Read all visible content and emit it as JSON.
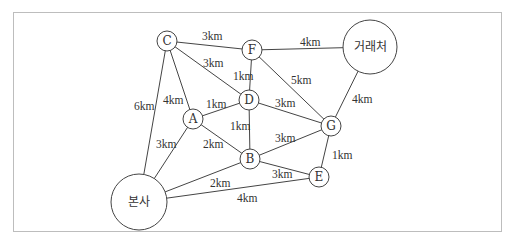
{
  "diagram": {
    "type": "weighted-graph",
    "frame": {
      "border_color": "#bdbdbd"
    },
    "nodes": [
      {
        "id": "C",
        "label": "C",
        "x": 167,
        "y": 41,
        "r": 10
      },
      {
        "id": "F",
        "label": "F",
        "x": 252,
        "y": 50,
        "r": 10
      },
      {
        "id": "D",
        "label": "D",
        "x": 249,
        "y": 100,
        "r": 10
      },
      {
        "id": "A",
        "label": "A",
        "x": 193,
        "y": 119,
        "r": 10
      },
      {
        "id": "G",
        "label": "G",
        "x": 331,
        "y": 126,
        "r": 10
      },
      {
        "id": "B",
        "label": "B",
        "x": 250,
        "y": 159,
        "r": 10
      },
      {
        "id": "E",
        "label": "E",
        "x": 319,
        "y": 177,
        "r": 10
      },
      {
        "id": "HQ",
        "label": "본사",
        "x": 139,
        "y": 202,
        "r": 28
      },
      {
        "id": "CLIENT",
        "label": "거래처",
        "x": 370,
        "y": 47,
        "r": 27
      }
    ],
    "edges": [
      {
        "from": "C",
        "to": "F",
        "label": "3km",
        "lx": 202,
        "ly": 40
      },
      {
        "from": "F",
        "to": "CLIENT",
        "label": "4km",
        "lx": 300,
        "ly": 46
      },
      {
        "from": "C",
        "to": "D",
        "label": "3km",
        "lx": 203,
        "ly": 67
      },
      {
        "from": "F",
        "to": "D",
        "label": "1km",
        "lx": 233,
        "ly": 80
      },
      {
        "from": "F",
        "to": "G",
        "label": "5km",
        "lx": 291,
        "ly": 84
      },
      {
        "from": "CLIENT",
        "to": "G",
        "label": "4km",
        "lx": 352,
        "ly": 103
      },
      {
        "from": "C",
        "to": "HQ",
        "label": "6km",
        "lx": 134,
        "ly": 110
      },
      {
        "from": "C",
        "to": "A",
        "label": "4km",
        "lx": 163,
        "ly": 104
      },
      {
        "from": "A",
        "to": "D",
        "label": "1km",
        "lx": 206,
        "ly": 108
      },
      {
        "from": "D",
        "to": "G",
        "label": "3km",
        "lx": 275,
        "ly": 107
      },
      {
        "from": "D",
        "to": "B",
        "label": "1km",
        "lx": 230,
        "ly": 130
      },
      {
        "from": "A",
        "to": "HQ",
        "label": "3km",
        "lx": 156,
        "ly": 148
      },
      {
        "from": "A",
        "to": "B",
        "label": "2km",
        "lx": 203,
        "ly": 148
      },
      {
        "from": "B",
        "to": "G",
        "label": "3km",
        "lx": 275,
        "ly": 142
      },
      {
        "from": "G",
        "to": "E",
        "label": "1km",
        "lx": 332,
        "ly": 159
      },
      {
        "from": "B",
        "to": "E",
        "label": "3km",
        "lx": 272,
        "ly": 178
      },
      {
        "from": "HQ",
        "to": "B",
        "label": "2km",
        "lx": 210,
        "ly": 187
      },
      {
        "from": "HQ",
        "to": "E",
        "label": "4km",
        "lx": 237,
        "ly": 202
      }
    ]
  }
}
